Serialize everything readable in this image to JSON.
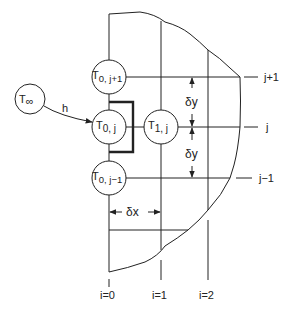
{
  "diagram": {
    "type": "finite-difference grid at convective boundary",
    "nodes": [
      {
        "id": "T0_jp1",
        "label_main": "T",
        "label_sub": "0, j+1",
        "cx": 109,
        "cy": 77
      },
      {
        "id": "T0_j",
        "label_main": "T",
        "label_sub": "0, j",
        "cx": 109,
        "cy": 127
      },
      {
        "id": "T1_j",
        "label_main": "T",
        "label_sub": "1, j",
        "cx": 161,
        "cy": 127
      },
      {
        "id": "T0_jm1",
        "label_main": "T",
        "label_sub": "0, j−1",
        "cx": 109,
        "cy": 178
      }
    ],
    "ambient": {
      "label_main": "T",
      "label_sub": "∞",
      "cx": 30,
      "cy": 99
    },
    "convection_label": "h",
    "spacing": {
      "dy_label": "δy",
      "dx_label": "δx"
    },
    "row_labels": {
      "jp1": "j+1",
      "j": "j",
      "jm1": "j−1"
    },
    "column_labels": {
      "i0": "i=0",
      "i1": "i=1",
      "i2": "i=2"
    }
  }
}
